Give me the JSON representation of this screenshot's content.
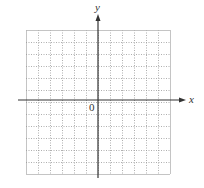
{
  "diagram": {
    "type": "coordinate-plane",
    "x_axis_label": "x",
    "y_axis_label": "y",
    "origin_label": "0",
    "grid": {
      "columns": 12,
      "rows": 12,
      "left": 26,
      "top": 30,
      "cell_size": 12,
      "line_style": "dotted",
      "line_color": "#9a9a9a",
      "border_color": "#b5b5b5"
    },
    "axes": {
      "origin_x": 98,
      "origin_y": 100,
      "x_start": 18,
      "x_end": 186,
      "y_start": 14,
      "y_end": 178,
      "color": "#333333"
    }
  }
}
